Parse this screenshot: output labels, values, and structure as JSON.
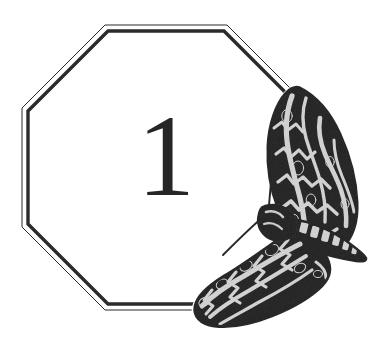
{
  "page": {
    "kind": "decorative-chapter-ornament",
    "width": 392,
    "height": 343,
    "background_color": "#ffffff",
    "alt_text": "Octagonal double-ruled frame enclosing the chapter number 1, with an engraved hawk-moth perched over the lower right of the frame."
  },
  "frame": {
    "name": "octagonal-double-rule-frame",
    "shape": "octagon",
    "line_style": "double rule: thin outer line, thick inner line",
    "stroke_color": "#2b2b2b",
    "outer_line_width": 1,
    "inner_line_width": 3.4,
    "gap": 2.6,
    "bounds": {
      "left": 22,
      "top": 25,
      "right": 310,
      "bottom": 310
    },
    "corner_cut": 83,
    "outer_points": "105,25 227,25 310,108 310,227 227,310 105,310 22,227 22,108",
    "inner_points": "108,31 224,31 304,111 304,224 224,304 108,304 28,224 28,111"
  },
  "numeral": {
    "name": "chapter-number",
    "value": "1",
    "color": "#262626",
    "font_size_px": 116,
    "center_x": 166,
    "center_y": 160
  },
  "moth": {
    "name": "hawk-moth-engraving",
    "common_name": "hawk-moth",
    "family": "Sphingidae",
    "style": "wood-engraving / stipple halftone",
    "dark_color": "#2a2a2a",
    "mid_color": "#4a4a4a",
    "light_color": "#d8d8d8",
    "highlight_color": "#efefef",
    "bounds": {
      "left": 193,
      "top": 88,
      "right": 367,
      "bottom": 326
    },
    "parts": [
      {
        "name": "forewing-upper-right",
        "bounds": {
          "left": 268,
          "top": 88,
          "right": 358,
          "bottom": 252
        }
      },
      {
        "name": "head-thorax",
        "bounds": {
          "left": 258,
          "top": 200,
          "right": 300,
          "bottom": 232
        }
      },
      {
        "name": "abdomen-banded",
        "bounds": {
          "left": 295,
          "top": 218,
          "right": 367,
          "bottom": 262
        }
      },
      {
        "name": "hindwing-lower-left",
        "bounds": {
          "left": 193,
          "top": 238,
          "right": 330,
          "bottom": 326
        }
      },
      {
        "name": "antenna",
        "from": [
          273,
          154
        ],
        "to": [
          268,
          212
        ]
      },
      {
        "name": "foreleg-proboscis",
        "from": [
          262,
          218
        ],
        "to": [
          222,
          256
        ]
      }
    ],
    "abdomen_segment_count": 7
  }
}
